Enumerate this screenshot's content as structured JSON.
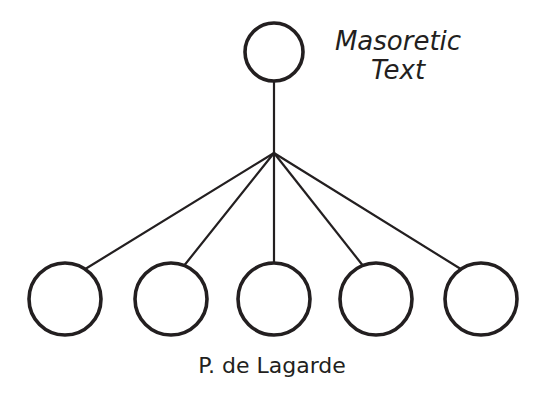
{
  "diagram": {
    "kind": "stemma-codicum",
    "background_color": "#ffffff",
    "stroke_color": "#231f20",
    "node_fill_color": "#ffffff",
    "node_stroke_width": 3.6,
    "edge_stroke_width": 2.2,
    "labels": {
      "root": {
        "name": "masoretic-text-label",
        "lines": [
          "Masoretic",
          "Text"
        ],
        "line1": "Masoretic",
        "line2": "Text",
        "style": "italic",
        "font_size_px": 26,
        "anchor_x": 398,
        "line1_y": 50,
        "line2_y": 79,
        "color": "#231f20"
      },
      "bottom": {
        "name": "p-de-lagarde-label",
        "text": "P. de Lagarde",
        "style": "normal",
        "font_size_px": 22,
        "anchor_x": 272,
        "y": 373,
        "color": "#231f20"
      }
    },
    "nodes": [
      {
        "id": "root",
        "name": "root-node",
        "cx": 274,
        "cy": 52,
        "r": 29
      },
      {
        "id": "leaf1",
        "name": "leaf-node-1",
        "cx": 65,
        "cy": 299,
        "r": 36
      },
      {
        "id": "leaf2",
        "name": "leaf-node-2",
        "cx": 171,
        "cy": 299,
        "r": 36
      },
      {
        "id": "leaf3",
        "name": "leaf-node-3",
        "cx": 274,
        "cy": 299,
        "r": 36
      },
      {
        "id": "leaf4",
        "name": "leaf-node-4",
        "cx": 376,
        "cy": 299,
        "r": 36
      },
      {
        "id": "leaf5",
        "name": "leaf-node-5",
        "cx": 481,
        "cy": 299,
        "r": 36
      }
    ],
    "junction": {
      "name": "fan-junction-point",
      "x": 274,
      "y": 153
    },
    "edges": [
      {
        "id": "stem",
        "name": "edge-root-to-junction",
        "x1": 274,
        "y1": 81,
        "x2": 274,
        "y2": 153
      },
      {
        "id": "fan-leaf1",
        "name": "edge-junction-to-leaf-1",
        "x1": 274,
        "y1": 153,
        "x2": 82,
        "y2": 271
      },
      {
        "id": "fan-leaf2",
        "name": "edge-junction-to-leaf-2",
        "x1": 274,
        "y1": 153,
        "x2": 183,
        "y2": 267
      },
      {
        "id": "fan-leaf3",
        "name": "edge-junction-to-leaf-3",
        "x1": 274,
        "y1": 153,
        "x2": 274,
        "y2": 263
      },
      {
        "id": "fan-leaf4",
        "name": "edge-junction-to-leaf-4",
        "x1": 274,
        "y1": 153,
        "x2": 364,
        "y2": 267
      },
      {
        "id": "fan-leaf5",
        "name": "edge-junction-to-leaf-5",
        "x1": 274,
        "y1": 153,
        "x2": 464,
        "y2": 271
      }
    ]
  }
}
